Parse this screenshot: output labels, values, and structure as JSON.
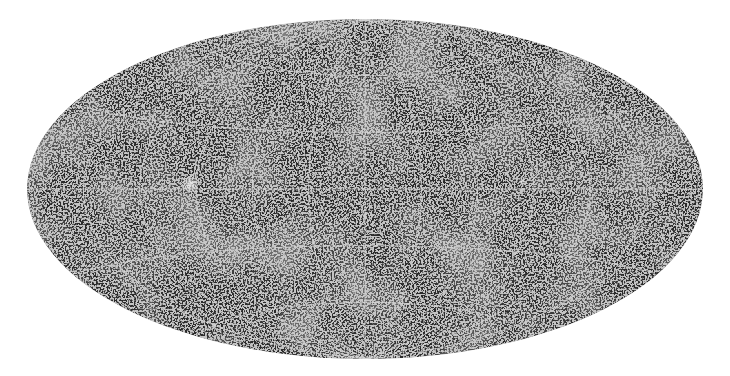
{
  "image": {
    "subject": "all-sky map of galaxy distribution",
    "projection": "Aitoff (equal-area elliptical)",
    "background_color": "#ffffff",
    "sky_color": "#2b2b2b",
    "point_color": "#e8e8e8",
    "grid_color": "#d8d8d8",
    "ellipse": {
      "cx": 365,
      "cy": 189,
      "rx": 338,
      "ry": 170
    },
    "graticule": {
      "meridian_step_deg": 30,
      "parallel_step_deg": 30
    },
    "bright_features": [
      {
        "name": "bright-cluster-left",
        "x": 190,
        "y": 184,
        "r": 9
      },
      {
        "name": "bright-knot-right",
        "x": 522,
        "y": 181,
        "r": 3
      }
    ]
  }
}
